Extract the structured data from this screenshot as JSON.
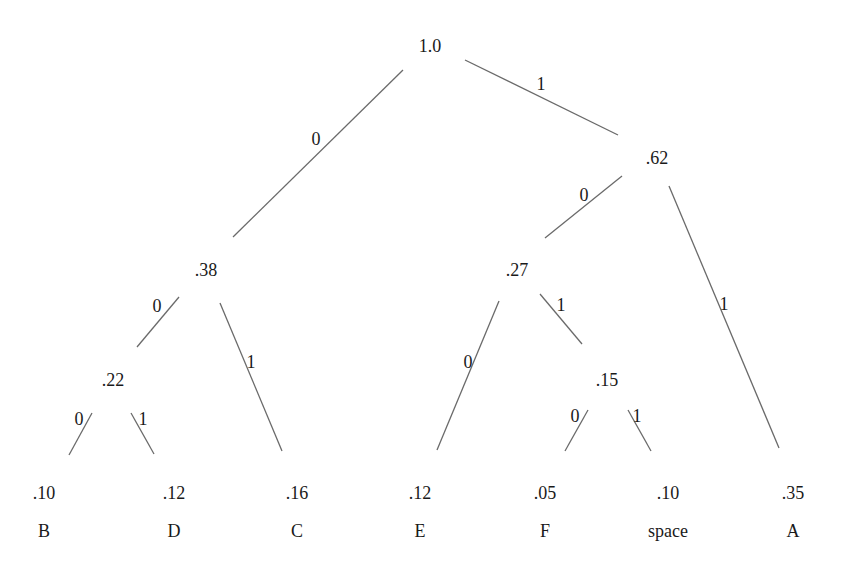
{
  "diagram": {
    "type": "huffman-tree",
    "nodes": [
      {
        "id": "root",
        "label": "1.0",
        "x": 430,
        "y": 48
      },
      {
        "id": "n62",
        "label": ".62",
        "x": 657,
        "y": 160
      },
      {
        "id": "n38",
        "label": ".38",
        "x": 206,
        "y": 272
      },
      {
        "id": "n27",
        "label": ".27",
        "x": 517,
        "y": 272
      },
      {
        "id": "n22",
        "label": ".22",
        "x": 113,
        "y": 382
      },
      {
        "id": "n15",
        "label": ".15",
        "x": 607,
        "y": 382
      }
    ],
    "leaves": [
      {
        "id": "B",
        "prob": ".10",
        "symbol": "B",
        "x": 44,
        "y": 495
      },
      {
        "id": "D",
        "prob": ".12",
        "symbol": "D",
        "x": 174,
        "y": 495
      },
      {
        "id": "C",
        "prob": ".16",
        "symbol": "C",
        "x": 297,
        "y": 495
      },
      {
        "id": "E",
        "prob": ".12",
        "symbol": "E",
        "x": 420,
        "y": 495
      },
      {
        "id": "F",
        "prob": ".05",
        "symbol": "F",
        "x": 545,
        "y": 495
      },
      {
        "id": "space",
        "prob": ".10",
        "symbol": "space",
        "x": 668,
        "y": 495
      },
      {
        "id": "A",
        "prob": ".35",
        "symbol": "A",
        "x": 793,
        "y": 495
      }
    ],
    "edges": [
      {
        "from": "root",
        "to": "n38",
        "bit": "0",
        "x1": 403,
        "y1": 70,
        "x2": 233,
        "y2": 237,
        "lx": 316,
        "ly": 141
      },
      {
        "from": "root",
        "to": "n62",
        "bit": "1",
        "x1": 465,
        "y1": 60,
        "x2": 618,
        "y2": 135,
        "lx": 541,
        "ly": 86
      },
      {
        "from": "n62",
        "to": "n27",
        "bit": "0",
        "x1": 622,
        "y1": 176,
        "x2": 545,
        "y2": 238,
        "lx": 584,
        "ly": 197
      },
      {
        "from": "n62",
        "to": "A",
        "bit": "1",
        "x1": 669,
        "y1": 186,
        "x2": 779,
        "y2": 448,
        "lx": 724,
        "ly": 306
      },
      {
        "from": "n38",
        "to": "n22",
        "bit": "0",
        "x1": 179,
        "y1": 297,
        "x2": 137,
        "y2": 347,
        "lx": 157,
        "ly": 308
      },
      {
        "from": "n38",
        "to": "C",
        "bit": "1",
        "x1": 220,
        "y1": 303,
        "x2": 282,
        "y2": 451,
        "lx": 251,
        "ly": 364
      },
      {
        "from": "n27",
        "to": "E",
        "bit": "0",
        "x1": 499,
        "y1": 301,
        "x2": 437,
        "y2": 450,
        "lx": 468,
        "ly": 364
      },
      {
        "from": "n27",
        "to": "n15",
        "bit": "1",
        "x1": 540,
        "y1": 294,
        "x2": 582,
        "y2": 344,
        "lx": 561,
        "ly": 307
      },
      {
        "from": "n22",
        "to": "B",
        "bit": "0",
        "x1": 92,
        "y1": 413,
        "x2": 69,
        "y2": 455,
        "lx": 79,
        "ly": 421
      },
      {
        "from": "n22",
        "to": "D",
        "bit": "1",
        "x1": 131,
        "y1": 413,
        "x2": 154,
        "y2": 454,
        "lx": 143,
        "ly": 421
      },
      {
        "from": "n15",
        "to": "F",
        "bit": "0",
        "x1": 588,
        "y1": 410,
        "x2": 565,
        "y2": 451,
        "lx": 575,
        "ly": 418
      },
      {
        "from": "n15",
        "to": "space",
        "bit": "1",
        "x1": 628,
        "y1": 410,
        "x2": 651,
        "y2": 451,
        "lx": 637,
        "ly": 418
      }
    ]
  }
}
